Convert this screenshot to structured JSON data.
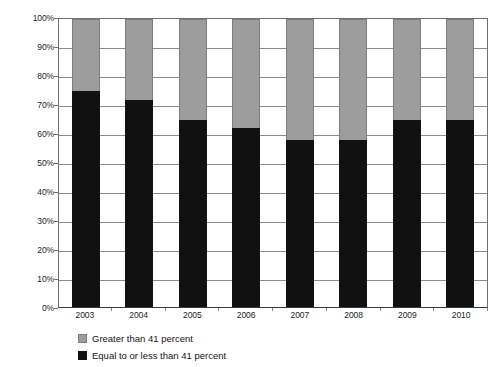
{
  "chart_data": {
    "type": "bar",
    "subtype": "stacked-100-percent",
    "title": "",
    "xlabel": "",
    "ylabel": "",
    "ylim": [
      0,
      100
    ],
    "yticks": [
      "0%",
      "10%",
      "20%",
      "30%",
      "40%",
      "50%",
      "60%",
      "70%",
      "80%",
      "90%",
      "100%"
    ],
    "ytick_values": [
      0,
      10,
      20,
      30,
      40,
      50,
      60,
      70,
      80,
      90,
      100
    ],
    "grid": true,
    "legend_position": "bottom-left",
    "categories": [
      "2003",
      "2004",
      "2005",
      "2006",
      "2007",
      "2008",
      "2009",
      "2010"
    ],
    "series": [
      {
        "name": "Equal to or less than 41 percent",
        "color": "#111111",
        "stack_order": "bottom",
        "values": [
          75,
          72,
          65,
          62,
          58,
          58,
          65,
          65
        ]
      },
      {
        "name": "Greater than 41 percent",
        "color": "#9d9d9d",
        "stack_order": "top",
        "values": [
          25,
          28,
          35,
          38,
          42,
          42,
          35,
          35
        ]
      }
    ]
  },
  "legend": {
    "items": [
      {
        "label": "Greater than 41 percent",
        "swatch": "gray"
      },
      {
        "label": "Equal to or less than 41 percent",
        "swatch": "black"
      }
    ]
  },
  "colors": {
    "series_gray": "#9d9d9d",
    "series_black": "#111111",
    "gridline": "#8a8a8a",
    "axis": "#6f6f6f",
    "text": "#1c1c1c",
    "background": "#ffffff"
  }
}
